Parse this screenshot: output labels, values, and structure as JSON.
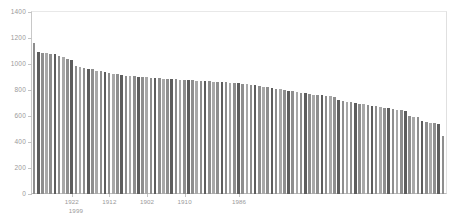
{
  "chart_data": {
    "type": "bar",
    "title": "",
    "subtitle": "",
    "xlabel": "",
    "ylabel": "",
    "ylim": [
      0,
      1400
    ],
    "xlim": [
      0,
      99
    ],
    "grid": false,
    "legend": null,
    "y_ticks": [
      1400,
      1200,
      1000,
      800,
      600,
      400,
      200,
      0
    ],
    "x_tick_labels": [
      "1922",
      "1912",
      "1902",
      "1910",
      "1986"
    ],
    "x_tick_labels_row2": [
      "1999"
    ],
    "x_tick_positions": [
      9,
      18,
      27,
      36,
      49
    ],
    "x_tick_positions_row2": [
      10
    ],
    "categories": [
      "1",
      "2",
      "3",
      "4",
      "5",
      "6",
      "7",
      "8",
      "9",
      "10",
      "11",
      "12",
      "13",
      "14",
      "15",
      "16",
      "17",
      "18",
      "19",
      "20",
      "21",
      "22",
      "23",
      "24",
      "25",
      "26",
      "27",
      "28",
      "29",
      "30",
      "31",
      "32",
      "33",
      "34",
      "35",
      "36",
      "37",
      "38",
      "39",
      "40",
      "41",
      "42",
      "43",
      "44",
      "45",
      "46",
      "47",
      "48",
      "49",
      "50",
      "51",
      "52",
      "53",
      "54",
      "55",
      "56",
      "57",
      "58",
      "59",
      "60",
      "61",
      "62",
      "63",
      "64",
      "65",
      "66",
      "67",
      "68",
      "69",
      "70",
      "71",
      "72",
      "73",
      "74",
      "75",
      "76",
      "77",
      "78",
      "79",
      "80",
      "81",
      "82",
      "83",
      "84",
      "85",
      "86",
      "87",
      "88",
      "89",
      "90",
      "91",
      "92",
      "93",
      "94",
      "95",
      "96",
      "97",
      "98",
      "99"
    ],
    "values": [
      1160,
      1090,
      1085,
      1085,
      1080,
      1075,
      1060,
      1055,
      1035,
      1030,
      985,
      975,
      970,
      965,
      960,
      950,
      945,
      935,
      930,
      925,
      920,
      915,
      910,
      908,
      905,
      902,
      900,
      898,
      895,
      893,
      890,
      888,
      886,
      884,
      882,
      880,
      878,
      876,
      874,
      872,
      870,
      868,
      866,
      864,
      862,
      860,
      858,
      856,
      854,
      852,
      850,
      845,
      840,
      835,
      830,
      825,
      820,
      815,
      810,
      805,
      800,
      795,
      790,
      785,
      780,
      775,
      770,
      765,
      760,
      758,
      755,
      752,
      748,
      720,
      715,
      710,
      705,
      700,
      695,
      690,
      685,
      680,
      675,
      670,
      665,
      660,
      655,
      650,
      645,
      640,
      600,
      595,
      590,
      560,
      555,
      550,
      545,
      540,
      450
    ],
    "bar_tones": [
      "mid",
      "dark",
      "mid",
      "light",
      "mid",
      "dark",
      "mid",
      "light",
      "mid",
      "dark",
      "mid",
      "light",
      "mid",
      "dark",
      "mid",
      "light",
      "mid",
      "dark",
      "mid",
      "light",
      "mid",
      "dark",
      "mid",
      "light",
      "mid",
      "dark",
      "mid",
      "light",
      "mid",
      "dark",
      "mid",
      "light",
      "mid",
      "dark",
      "mid",
      "light",
      "mid",
      "dark",
      "mid",
      "light",
      "mid",
      "dark",
      "mid",
      "light",
      "mid",
      "dark",
      "mid",
      "light",
      "mid",
      "dark",
      "mid",
      "light",
      "mid",
      "dark",
      "mid",
      "light",
      "mid",
      "dark",
      "mid",
      "light",
      "mid",
      "dark",
      "mid",
      "light",
      "mid",
      "dark",
      "mid",
      "light",
      "mid",
      "dark",
      "mid",
      "light",
      "mid",
      "dark",
      "mid",
      "light",
      "mid",
      "dark",
      "mid",
      "light",
      "mid",
      "dark",
      "mid",
      "light",
      "mid",
      "dark",
      "mid",
      "light",
      "mid",
      "dark",
      "mid",
      "light",
      "mid",
      "dark",
      "mid",
      "light",
      "mid",
      "dark",
      "mid"
    ],
    "colors": {
      "bar_dark": "#5d5d5d",
      "bar_mid": "#8e8e8e",
      "bar_light": "#a8a8a8",
      "axis": "#c4c4c4",
      "tick_text": "#9a9a9a",
      "background": "#ffffff"
    }
  }
}
